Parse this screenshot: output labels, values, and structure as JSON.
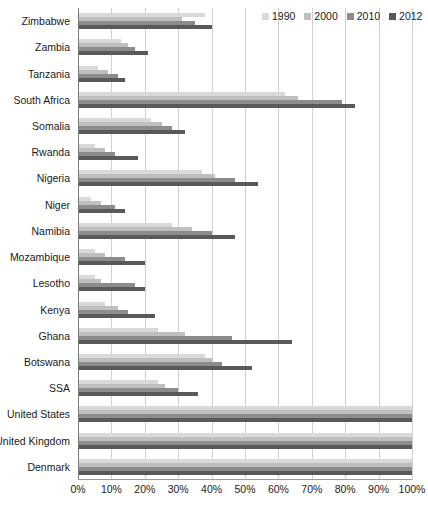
{
  "chart_data": {
    "type": "bar",
    "orientation": "horizontal",
    "title": "",
    "xlabel": "",
    "ylabel": "",
    "xlim": [
      0,
      100
    ],
    "xticks": [
      "0%",
      "10%",
      "20%",
      "30%",
      "40%",
      "50%",
      "60%",
      "70%",
      "80%",
      "90%",
      "100%"
    ],
    "xtick_values": [
      0,
      10,
      20,
      30,
      40,
      50,
      60,
      70,
      80,
      90,
      100
    ],
    "grid": true,
    "legend_position": "top-right",
    "series": [
      {
        "name": "1990",
        "color": "#d9d9d9",
        "values": [
          38,
          13,
          6,
          62,
          22,
          5,
          37,
          4,
          28,
          5,
          5,
          8,
          24,
          38,
          24,
          100,
          100,
          100
        ]
      },
      {
        "name": "2000",
        "color": "#bfbfbf",
        "values": [
          31,
          15,
          9,
          66,
          25,
          8,
          41,
          7,
          34,
          8,
          7,
          12,
          32,
          40,
          26,
          100,
          100,
          100
        ]
      },
      {
        "name": "2010",
        "color": "#8c8c8c",
        "values": [
          35,
          17,
          12,
          79,
          28,
          11,
          47,
          11,
          40,
          14,
          17,
          15,
          46,
          43,
          30,
          100,
          100,
          100
        ]
      },
      {
        "name": "2012",
        "color": "#595959",
        "values": [
          40,
          21,
          14,
          83,
          32,
          18,
          54,
          14,
          47,
          20,
          20,
          23,
          64,
          52,
          36,
          100,
          100,
          100
        ]
      }
    ],
    "categories": [
      "Zimbabwe",
      "Zambia",
      "Tanzania",
      "South Africa",
      "Somalia",
      "Rwanda",
      "Nigeria",
      "Niger",
      "Namibia",
      "Mozambique",
      "Lesotho",
      "Kenya",
      "Ghana",
      "Botswana",
      "SSA",
      "United States",
      "United Kingdom",
      "Denmark"
    ]
  }
}
